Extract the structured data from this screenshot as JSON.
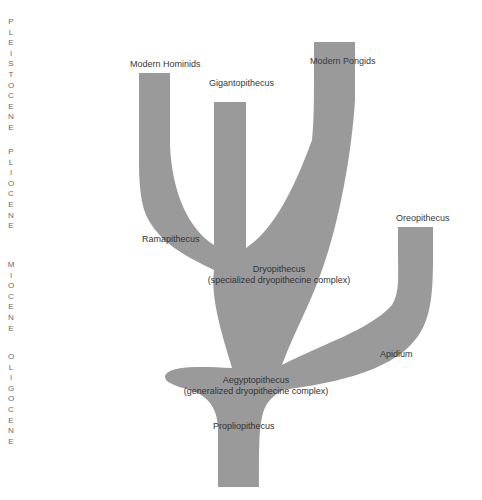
{
  "epochs": [
    {
      "name": "PLEISTOCENE",
      "letters": [
        "P",
        "L",
        "E",
        "I",
        "S",
        "T",
        "O",
        "C",
        "E",
        "N",
        "E"
      ],
      "top": 17
    },
    {
      "name": "PLIOCENE",
      "letters": [
        "P",
        "L",
        "I",
        "O",
        "C",
        "E",
        "N",
        "E"
      ],
      "top": 138
    },
    {
      "name": "MIOCENE",
      "letters": [
        "M",
        "I",
        "O",
        "C",
        "E",
        "N",
        "E"
      ],
      "top": 258
    },
    {
      "name": "OLIGOCENE",
      "letters": [
        "O",
        "L",
        "I",
        "G",
        "O",
        "C",
        "E",
        "N",
        "E"
      ],
      "top": 353
    }
  ],
  "taxa": {
    "modern_hominids": "Modern Hominids",
    "gigantopithecus": "Gigantopithecus",
    "modern_pongids": "Modern Pongids",
    "oreopithecus": "Oreopithecus",
    "ramapithecus": "Ramapithecus",
    "dryopithecus": "Dryopithecus",
    "dryopithecus_note": "(specialized dryopithecine complex)",
    "apidium": "Apidium",
    "aegyptopithecus": "Aegyptopithecus",
    "aegyptopithecus_note": "(generalized dryopithecine complex)",
    "propliopithecus": "Propliopithecus"
  },
  "colors": {
    "branch_fill": "#9a9a9a",
    "label_text": "#333333",
    "epoch_text": "#6a6a6a",
    "background": "#ffffff"
  }
}
